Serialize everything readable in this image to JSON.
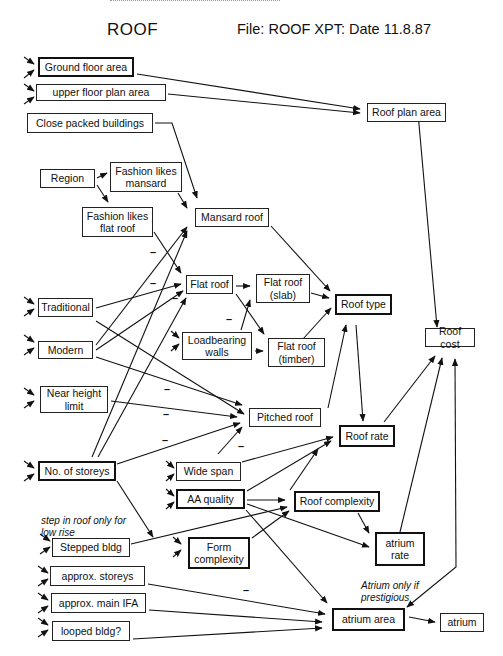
{
  "header": {
    "title": "ROOF",
    "file_info": "File: ROOF XPT: Date 11.8.87"
  },
  "nodes": {
    "ground_floor_area": "Ground floor area",
    "upper_floor_plan_area": "upper floor plan area",
    "roof_plan_area": "Roof plan area",
    "close_packed_buildings": "Close packed buildings",
    "region": "Region",
    "fashion_likes_mansard": "Fashion likes mansard",
    "fashion_likes_flat_roof": "Fashion likes flat roof",
    "mansard_roof": "Mansard roof",
    "flat_roof": "Flat roof",
    "flat_roof_slab": "Flat roof (slab)",
    "flat_roof_timber": "Flat roof (timber)",
    "roof_type": "Roof type",
    "roof_cost": "Roof cost",
    "traditional": "Traditional",
    "modern": "Modern",
    "loadbearing_walls": "Loadbearing walls",
    "near_height_limit": "Near height limit",
    "pitched_roof": "Pitched roof",
    "roof_rate": "Roof rate",
    "no_of_storeys": "No. of storeys",
    "wide_span": "Wide span",
    "aa_quality": "AA quality",
    "roof_complexity": "Roof complexity",
    "stepped_bldg": "Stepped bldg",
    "form_complexity": "Form complexity",
    "atrium_rate": "atrium rate",
    "approx_storeys": "approx. storeys",
    "approx_main_ifa": "approx. main IFA",
    "looped_bldg": "looped bldg?",
    "atrium_area": "atrium area",
    "atrium": "atrium"
  },
  "notes": {
    "stepped_note": "step in roof only for low rise",
    "atrium_note": "Atrium only if prestigious"
  },
  "negation_marker": "–"
}
